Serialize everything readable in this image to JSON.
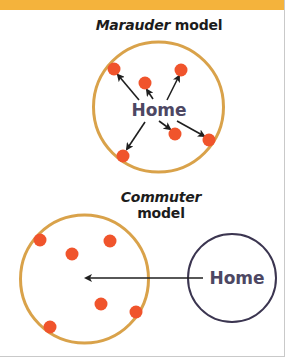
{
  "colors": {
    "top_bar": "#f4b33c",
    "range_circle": "#d9a24a",
    "home_circle": "#3b3550",
    "dot": "#f0542c",
    "arrow": "#1f1f1f",
    "home_text": "#4d4763",
    "title_text": "#1c1c1c"
  },
  "marauder": {
    "title_italic": "Marauder",
    "title_rest": " model",
    "home_label": "Home",
    "range_circle": {
      "cx": 158.5,
      "cy": 107,
      "r": 65
    },
    "dots": [
      {
        "x": 114,
        "y": 69
      },
      {
        "x": 145,
        "y": 83
      },
      {
        "x": 181,
        "y": 70
      },
      {
        "x": 123,
        "y": 156
      },
      {
        "x": 175,
        "y": 134
      },
      {
        "x": 209,
        "y": 140
      }
    ]
  },
  "commuter": {
    "title_italic": "Commuter",
    "title_line2": "model",
    "home_label": "Home",
    "range_circle": {
      "cx": 84.5,
      "cy": 279,
      "r": 64
    },
    "home_circle": {
      "cx": 232,
      "cy": 278,
      "r": 44
    },
    "dots": [
      {
        "x": 40,
        "y": 240
      },
      {
        "x": 72,
        "y": 254
      },
      {
        "x": 110,
        "y": 241
      },
      {
        "x": 101,
        "y": 304
      },
      {
        "x": 136,
        "y": 312
      },
      {
        "x": 50,
        "y": 327
      }
    ],
    "arrow": {
      "x1": 203,
      "y1": 278,
      "x2": 84,
      "y2": 278
    }
  }
}
